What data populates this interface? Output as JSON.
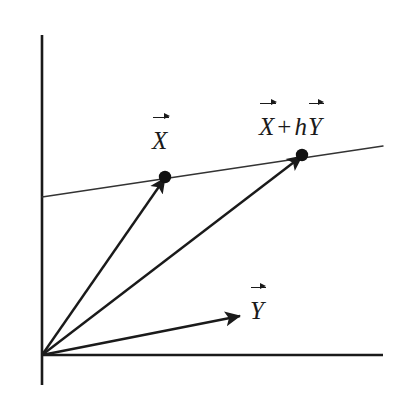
{
  "figure": {
    "background_color": "#ffffff",
    "ink_color": "#1a1a1a",
    "width": 409,
    "height": 399
  },
  "labels": {
    "x": {
      "symbol": "X"
    },
    "y": {
      "symbol": "Y"
    },
    "x_plus_hy": {
      "symbol_1": "X",
      "operator": "+",
      "scalar": "h",
      "symbol_2": "Y"
    }
  },
  "chart_data": {
    "type": "scatter",
    "title": "",
    "xlabel": "",
    "ylabel": "",
    "grid": false,
    "legend": null,
    "axes": {
      "origin": [
        42,
        355
      ],
      "x_axis": {
        "from": [
          42,
          355
        ],
        "to": [
          383,
          355
        ],
        "stroke_width": 2.6
      },
      "y_axis": {
        "from": [
          42,
          35
        ],
        "to": [
          42,
          385
        ],
        "stroke_width": 2.6
      }
    },
    "line": {
      "name": "line through X and X + hY",
      "from": [
        42,
        197
      ],
      "to": [
        383,
        146
      ],
      "stroke_width": 1.4
    },
    "vectors": [
      {
        "name": "X",
        "from": [
          42,
          355
        ],
        "to": [
          165,
          178
        ],
        "label": "X",
        "stroke_width": 2.4
      },
      {
        "name": "X + hY",
        "from": [
          42,
          355
        ],
        "to": [
          302,
          156
        ],
        "label": "X + hY",
        "stroke_width": 2.4
      },
      {
        "name": "Y",
        "from": [
          42,
          355
        ],
        "to": [
          240,
          316
        ],
        "label": "Y",
        "stroke_width": 2.4
      }
    ],
    "points": [
      {
        "name": "X",
        "x": 165,
        "y": 177,
        "radius": 6.2
      },
      {
        "name": "X + hY",
        "x": 302,
        "y": 155,
        "radius": 6.2
      }
    ]
  }
}
